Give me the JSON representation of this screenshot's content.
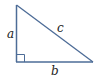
{
  "diagram": {
    "type": "right-triangle",
    "stroke_color": "#4d6c97",
    "labels": {
      "leg_vertical": "a",
      "leg_horizontal": "b",
      "hypotenuse": "c"
    },
    "right_angle_marker": true
  }
}
